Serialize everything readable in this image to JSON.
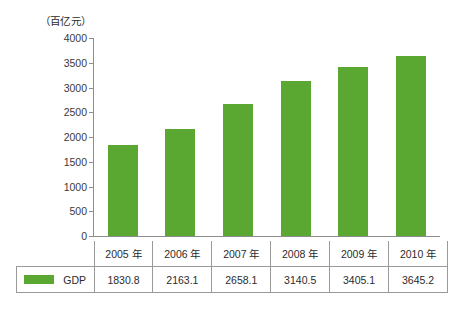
{
  "chart_data": {
    "type": "bar",
    "title": "",
    "subtitle": "",
    "unit_label": "（百亿元）",
    "xlabel": "",
    "ylabel": "",
    "ylim": [
      0,
      4000
    ],
    "ytick_step": 500,
    "yticks": [
      "4000",
      "3500",
      "3000",
      "2500",
      "2000",
      "1500",
      "1000",
      "500",
      "0"
    ],
    "ytick_values": [
      4000,
      3500,
      3000,
      2500,
      2000,
      1500,
      1000,
      500,
      0
    ],
    "grid": false,
    "legend_position": "bottom-left-table",
    "categories": [
      "2005 年",
      "2006 年",
      "2007 年",
      "2008 年",
      "2009 年",
      "2010 年"
    ],
    "series": [
      {
        "name": "GDP",
        "color": "#5aa832",
        "values": [
          1830.8,
          2163.1,
          2658.1,
          3140.5,
          3405.1,
          3645.2
        ],
        "value_labels": [
          "1830.8",
          "2163.1",
          "2658.1",
          "3140.5",
          "3405.1",
          "3645.2"
        ]
      }
    ]
  },
  "colors": {
    "bar": "#5aa832",
    "axis": "#8d8d8d",
    "table_border": "#9a9a9a",
    "text": "#2b2b2b",
    "background": "#ffffff"
  }
}
